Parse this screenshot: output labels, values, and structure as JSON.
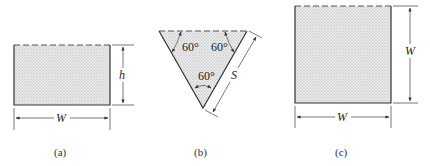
{
  "figure": {
    "panels": [
      {
        "id": "a",
        "caption": "(a)",
        "shape": "rectangle",
        "labels": {
          "width": "W",
          "height": "h"
        }
      },
      {
        "id": "b",
        "caption": "(b)",
        "shape": "inverted-equilateral-triangle",
        "labels": {
          "side": "S",
          "angle_left": "60°",
          "angle_right": "60°",
          "angle_bottom": "60°"
        }
      },
      {
        "id": "c",
        "caption": "(c)",
        "shape": "square",
        "labels": {
          "width": "W",
          "height": "W"
        }
      }
    ],
    "colors": {
      "fill": "#d9d9d9",
      "line": "#333333"
    }
  }
}
